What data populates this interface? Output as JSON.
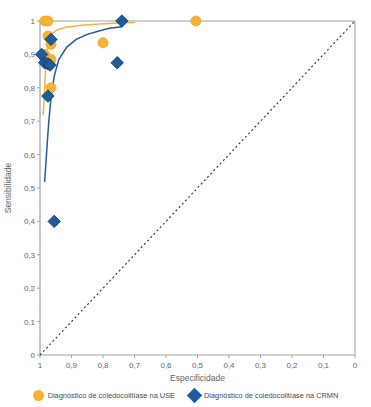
{
  "chart_data": {
    "type": "scatter",
    "title": "",
    "xlabel": "Especificidade",
    "ylabel": "Sensibilidade",
    "xlim": [
      1,
      0
    ],
    "ylim": [
      0,
      1
    ],
    "x_reversed": true,
    "grid": false,
    "legend_position": "bottom",
    "xticks": [
      "1",
      "0,9",
      "0,8",
      "0,7",
      "0,6",
      "0,5",
      "0,4",
      "0,3",
      "0,2",
      "0,1",
      "0"
    ],
    "xtick_values": [
      1,
      0.9,
      0.8,
      0.7,
      0.6,
      0.5,
      0.4,
      0.3,
      0.2,
      0.1,
      0
    ],
    "yticks": [
      "0",
      "0,1",
      "0,2",
      "0,3",
      "0,4",
      "0,5",
      "0,6",
      "0,7",
      "0,8",
      "0,9",
      "1"
    ],
    "ytick_values": [
      0,
      0.1,
      0.2,
      0.3,
      0.4,
      0.5,
      0.6,
      0.7,
      0.8,
      0.9,
      1
    ],
    "reference_line": {
      "name": "linha de referencia",
      "from": [
        1,
        0
      ],
      "to": [
        0,
        1
      ],
      "style": "dotted",
      "color": "#2b2b2b"
    },
    "series": [
      {
        "name": "Diagnóstico de coledocolitíase na USE",
        "marker": "circle",
        "color": "#F5B335",
        "points": [
          {
            "x": 0.985,
            "y": 1.0
          },
          {
            "x": 0.975,
            "y": 1.0
          },
          {
            "x": 0.505,
            "y": 1.0
          },
          {
            "x": 0.975,
            "y": 0.955
          },
          {
            "x": 0.965,
            "y": 0.93
          },
          {
            "x": 0.8,
            "y": 0.935
          },
          {
            "x": 0.985,
            "y": 0.9
          },
          {
            "x": 0.965,
            "y": 0.885
          },
          {
            "x": 0.965,
            "y": 0.8
          }
        ],
        "fit_curve": [
          [
            0.99,
            0.72
          ],
          [
            0.985,
            0.8
          ],
          [
            0.982,
            0.86
          ],
          [
            0.978,
            0.905
          ],
          [
            0.972,
            0.94
          ],
          [
            0.962,
            0.962
          ],
          [
            0.945,
            0.974
          ],
          [
            0.915,
            0.982
          ],
          [
            0.87,
            0.987
          ],
          [
            0.81,
            0.991
          ],
          [
            0.755,
            0.994
          ],
          [
            0.7,
            0.996
          ]
        ]
      },
      {
        "name": "Diagnóstico de coledocolitíase na CRMN",
        "marker": "diamond",
        "color": "#1F5C9E",
        "points": [
          {
            "x": 0.74,
            "y": 1.0
          },
          {
            "x": 0.965,
            "y": 0.945
          },
          {
            "x": 0.995,
            "y": 0.9
          },
          {
            "x": 0.985,
            "y": 0.875
          },
          {
            "x": 0.975,
            "y": 0.872
          },
          {
            "x": 0.968,
            "y": 0.868
          },
          {
            "x": 0.755,
            "y": 0.875
          },
          {
            "x": 0.975,
            "y": 0.775
          },
          {
            "x": 0.955,
            "y": 0.4
          }
        ],
        "fit_curve": [
          [
            0.985,
            0.52
          ],
          [
            0.978,
            0.62
          ],
          [
            0.972,
            0.7
          ],
          [
            0.965,
            0.77
          ],
          [
            0.955,
            0.835
          ],
          [
            0.94,
            0.885
          ],
          [
            0.915,
            0.922
          ],
          [
            0.885,
            0.945
          ],
          [
            0.85,
            0.96
          ],
          [
            0.81,
            0.971
          ],
          [
            0.78,
            0.978
          ],
          [
            0.74,
            0.983
          ]
        ]
      }
    ]
  },
  "axes": {
    "ylabel": "Sensibilidade",
    "xlabel": "Especificidade"
  },
  "legend": {
    "items": [
      {
        "label": "Diagnóstico de coledocolitíase na USE",
        "marker": "circle-marker",
        "color": "#F5B335"
      },
      {
        "label": "Diagnóstico de coledocolitíase na CRMN",
        "marker": "diamond-marker",
        "color": "#1F5C9E"
      }
    ]
  }
}
